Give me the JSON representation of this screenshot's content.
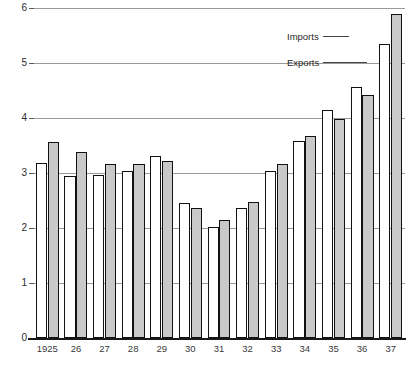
{
  "chart_data": {
    "type": "bar",
    "title": "",
    "subtitle": "",
    "xlabel": "",
    "ylabel": "",
    "categories": [
      "1925",
      "26",
      "27",
      "28",
      "29",
      "30",
      "31",
      "32",
      "33",
      "34",
      "35",
      "36",
      "37"
    ],
    "series": [
      {
        "name": "Exports",
        "color": "#ffffff",
        "values": [
          3.18,
          2.95,
          2.96,
          3.03,
          3.31,
          2.46,
          2.02,
          2.37,
          3.03,
          3.58,
          4.14,
          4.56,
          5.35
        ]
      },
      {
        "name": "Imports",
        "color": "#c9c9c9",
        "values": [
          3.57,
          3.38,
          3.16,
          3.17,
          3.22,
          2.36,
          2.15,
          2.48,
          3.17,
          3.68,
          3.98,
          4.42,
          5.9
        ]
      }
    ],
    "ylim": [
      0,
      6
    ],
    "yticks": [
      0,
      1,
      2,
      3,
      4,
      5,
      6
    ],
    "ytick_labels": [
      "0",
      "1",
      "2",
      "3",
      "4",
      "5",
      "6"
    ],
    "grid": true,
    "grid_axis": "y",
    "legend_position": "inside-top-right",
    "bar_border_color": "#111111"
  },
  "legend": {
    "imports": {
      "label": "Imports"
    },
    "exports": {
      "label": "Exports"
    }
  }
}
